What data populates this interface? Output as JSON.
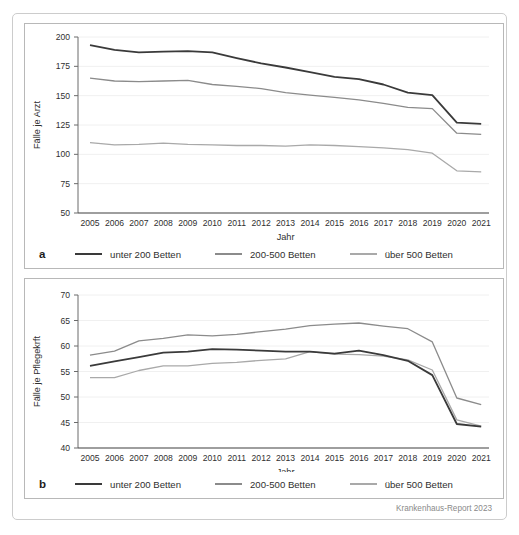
{
  "figure": {
    "source_note": "Krankenhaus-Report 2023"
  },
  "chart_data": [
    {
      "type": "line",
      "panel_label": "a",
      "ylabel": "Fälle je Arzt",
      "xlabel": "Jahr",
      "ylim": [
        50,
        200
      ],
      "ytick_step": 25,
      "grid": "horizontal-light",
      "legend_position": "bottom",
      "x": [
        2005,
        2006,
        2007,
        2008,
        2009,
        2010,
        2011,
        2012,
        2013,
        2014,
        2015,
        2016,
        2017,
        2018,
        2019,
        2020,
        2021
      ],
      "series": [
        {
          "name": "unter 200 Betten",
          "color": "#3a3a3a",
          "width": 1.8,
          "values": [
            193,
            189,
            187,
            187.5,
            188,
            187,
            182,
            177.5,
            174,
            170,
            166,
            164,
            159.5,
            152.5,
            150.5,
            127,
            126
          ]
        },
        {
          "name": "200-500 Betten",
          "color": "#8b8b8b",
          "width": 1.3,
          "values": [
            165,
            162.5,
            162,
            162.5,
            163,
            159.5,
            158,
            156,
            152.5,
            150.5,
            148.5,
            146.5,
            143.5,
            140,
            139,
            118,
            117
          ]
        },
        {
          "name": "über 500 Betten",
          "color": "#a9a9a9",
          "width": 1.3,
          "values": [
            110,
            108,
            108.5,
            109.5,
            108.5,
            108,
            107.5,
            107.5,
            107,
            108,
            107.5,
            106.5,
            105.5,
            104,
            101,
            86,
            85
          ]
        }
      ]
    },
    {
      "type": "line",
      "panel_label": "b",
      "ylabel": "Fälle je Pflegekrft",
      "xlabel": "Jahr",
      "ylim": [
        40,
        70
      ],
      "ytick_step": 5,
      "grid": "horizontal-light",
      "legend_position": "bottom",
      "x": [
        2005,
        2006,
        2007,
        2008,
        2009,
        2010,
        2011,
        2012,
        2013,
        2014,
        2015,
        2016,
        2017,
        2018,
        2019,
        2020,
        2021
      ],
      "series": [
        {
          "name": "unter 200 Betten",
          "color": "#3a3a3a",
          "width": 1.8,
          "values": [
            56.1,
            57.0,
            57.8,
            58.7,
            58.9,
            59.4,
            59.3,
            59.1,
            58.9,
            58.9,
            58.5,
            59.1,
            58.2,
            57.1,
            54.3,
            44.7,
            44.2
          ]
        },
        {
          "name": "200-500 Betten",
          "color": "#8b8b8b",
          "width": 1.3,
          "values": [
            58.2,
            59.0,
            61.0,
            61.5,
            62.2,
            62.0,
            62.3,
            62.8,
            63.3,
            64.0,
            64.3,
            64.5,
            63.9,
            63.4,
            60.8,
            49.8,
            48.5
          ]
        },
        {
          "name": "über 500 Betten",
          "color": "#a9a9a9",
          "width": 1.3,
          "values": [
            53.8,
            53.8,
            55.2,
            56.1,
            56.1,
            56.6,
            56.8,
            57.2,
            57.5,
            58.9,
            58.4,
            58.3,
            58.0,
            57.3,
            55.3,
            45.5,
            44.3
          ]
        }
      ]
    }
  ]
}
